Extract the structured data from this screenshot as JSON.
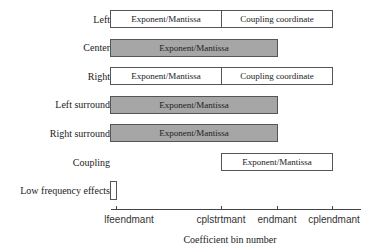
{
  "rows": [
    {
      "label": "Left",
      "segments": [
        {
          "text": "Exponent/Mantissa",
          "fill": "white"
        },
        {
          "text": "Coupling coordinate",
          "fill": "white"
        }
      ]
    },
    {
      "label": "Center",
      "segments": [
        {
          "text": "Exponent/Mantissa",
          "fill": "gray"
        }
      ]
    },
    {
      "label": "Right",
      "segments": [
        {
          "text": "Exponent/Mantissa",
          "fill": "white"
        },
        {
          "text": "Coupling coordinate",
          "fill": "white"
        }
      ]
    },
    {
      "label": "Left surround",
      "segments": [
        {
          "text": "Exponent/Mantissa",
          "fill": "gray"
        }
      ]
    },
    {
      "label": "Right surround",
      "segments": [
        {
          "text": "Exponent/Mantissa",
          "fill": "gray"
        }
      ]
    },
    {
      "label": "Coupling",
      "segments": [
        {
          "text": "Exponent/Mantissa",
          "fill": "white"
        }
      ]
    },
    {
      "label": "Low frequency effects",
      "segments": [
        {
          "text": "",
          "fill": "white"
        }
      ]
    }
  ],
  "axis": {
    "ticks": [
      "lfeendmant",
      "cplstrtmant",
      "endmant",
      "cplendmant"
    ],
    "title": "Coefficient bin number"
  },
  "colors": {
    "gray_fill": "#a6a6a6",
    "border": "#555555"
  }
}
